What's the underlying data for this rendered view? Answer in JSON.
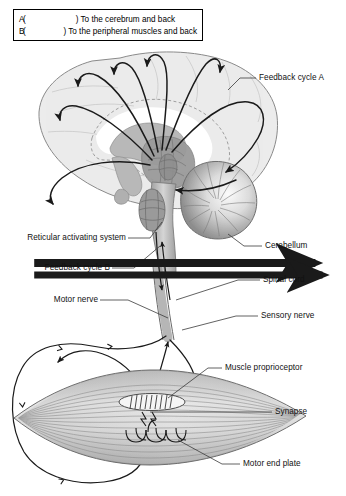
{
  "figure": {
    "caption": ""
  },
  "legend": {
    "box_border_color": "#000000",
    "items": [
      {
        "key": "A",
        "open_paren": "(",
        "close_paren": ")",
        "arrow_icon": "arrow-right-icon",
        "text": "To the cerebrum and back"
      },
      {
        "key": "B",
        "open_paren": "(",
        "close_paren": ")",
        "arrow_icon": "arrow-right-icon",
        "text": "To the peripheral muscles and back"
      }
    ]
  },
  "labels": {
    "feedback_cycle_a": "Feedback cycle A",
    "reticular_activating_system": "Reticular activating system",
    "feedback_cycle_b": "Feedback cycle B",
    "motor_nerve": "Motor nerve",
    "cerebellum": "Cerebellum",
    "spinal_cord": "Spinal cord",
    "sensory_nerve": "Sensory nerve",
    "muscle_proprioceptor": "Muscle proprioceptor",
    "synapse": "Synapse",
    "motor_end_plate": "Motor end plate"
  },
  "colors": {
    "stroke": "#1a1a1a",
    "leader": "#3a3a3a",
    "cortex_fill": "#ececec",
    "cortex_stroke": "#8a8a8a",
    "white_matter": "#ffffff",
    "basal_fill": "#b8b8b8",
    "brainstem_fill": "#9a9a9a",
    "reticular_fill": "#8f8f8f",
    "cerebellum_light": "#f2f2f2",
    "cerebellum_dark": "#8d8d8d",
    "muscle_light": "#f0f0f0",
    "muscle_mid": "#bdbdbd",
    "muscle_dark": "#9a9a9a",
    "spindle_fill": "#f5f5f5",
    "background": "#ffffff"
  }
}
